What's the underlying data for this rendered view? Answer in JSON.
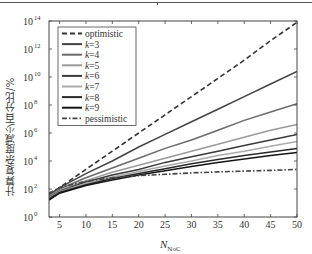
{
  "chart_data": {
    "type": "line",
    "title": "",
    "xlabel": "N",
    "xlabel_subscript": "NoC",
    "ylabel": "计算复杂度减少百分比/%",
    "xlim": [
      3,
      50
    ],
    "ylim_log10": [
      0,
      14
    ],
    "yscale": "log",
    "x_ticks": [
      5,
      10,
      15,
      20,
      25,
      30,
      35,
      40,
      45,
      50
    ],
    "y_ticks": [
      "10^0",
      "10^2",
      "10^4",
      "10^6",
      "10^8",
      "10^10",
      "10^12",
      "10^14"
    ],
    "y_tick_exponents": [
      0,
      2,
      4,
      6,
      8,
      10,
      12,
      14
    ],
    "grid": false,
    "legend_position": "upper left",
    "x": [
      3,
      5,
      10,
      15,
      20,
      25,
      30,
      35,
      40,
      45,
      50
    ],
    "series": [
      {
        "name": "optimistic",
        "style": "dashed",
        "color": "#333333",
        "log10_values": [
          1.6,
          2.1,
          3.4,
          4.7,
          6.0,
          7.3,
          8.6,
          9.9,
          11.2,
          12.6,
          13.9
        ]
      },
      {
        "name": "k=3",
        "style": "solid",
        "color": "#444444",
        "log10_values": [
          1.6,
          2.1,
          3.1,
          4.0,
          5.0,
          5.9,
          6.8,
          7.7,
          8.6,
          9.5,
          10.4
        ]
      },
      {
        "name": "k=4",
        "style": "solid",
        "color": "#6a6a6a",
        "log10_values": [
          1.5,
          2.0,
          2.8,
          3.5,
          4.2,
          4.9,
          5.5,
          6.2,
          6.9,
          7.5,
          8.1
        ]
      },
      {
        "name": "k=5",
        "style": "solid",
        "color": "#9a9a9a",
        "log10_values": [
          1.45,
          1.9,
          2.6,
          3.2,
          3.7,
          4.2,
          4.7,
          5.2,
          5.7,
          6.2,
          6.6
        ]
      },
      {
        "name": "k=6",
        "style": "solid",
        "color": "#3a3a3a",
        "log10_values": [
          1.4,
          1.85,
          2.5,
          3.0,
          3.4,
          3.9,
          4.3,
          4.7,
          5.1,
          5.5,
          5.9
        ]
      },
      {
        "name": "k=7",
        "style": "solid",
        "color": "#aaaaaa",
        "log10_values": [
          1.35,
          1.8,
          2.4,
          2.85,
          3.25,
          3.65,
          4.0,
          4.4,
          4.7,
          5.05,
          5.4
        ]
      },
      {
        "name": "k=8",
        "style": "solid",
        "color": "#2a2a2a",
        "log10_values": [
          1.3,
          1.75,
          2.3,
          2.75,
          3.1,
          3.45,
          3.8,
          4.1,
          4.4,
          4.65,
          4.9
        ]
      },
      {
        "name": "k=9",
        "style": "solid",
        "color": "#151515",
        "log10_values": [
          1.2,
          1.7,
          2.25,
          2.65,
          3.0,
          3.3,
          3.6,
          3.9,
          4.15,
          4.4,
          4.6
        ]
      },
      {
        "name": "pessimistic",
        "style": "dashdot",
        "color": "#444444",
        "log10_values": [
          1.7,
          2.1,
          2.55,
          2.8,
          2.95,
          3.05,
          3.15,
          3.22,
          3.28,
          3.33,
          3.4
        ]
      }
    ]
  },
  "legend": {
    "items": [
      {
        "label": "optimistic",
        "italic_k": false
      },
      {
        "label": "k=3"
      },
      {
        "label": "k=4"
      },
      {
        "label": "k=5"
      },
      {
        "label": "k=6"
      },
      {
        "label": "k=7"
      },
      {
        "label": "k=8"
      },
      {
        "label": "k=9"
      },
      {
        "label": "pessimistic"
      }
    ]
  },
  "axis": {
    "ylabel": "计算复杂度减少百分比/%",
    "xlabel_main": "N",
    "xlabel_sub": "NoC"
  }
}
